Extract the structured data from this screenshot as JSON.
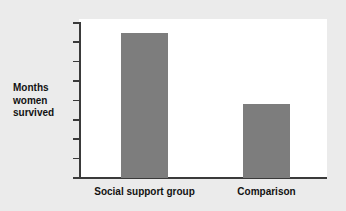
{
  "chart_data": {
    "type": "bar",
    "title": "",
    "xlabel": "",
    "ylabel": "Months\nwomen\nsurvived",
    "categories": [
      "Social support group",
      "Comparison"
    ],
    "values": [
      37.5,
      19.2
    ],
    "yticks": [
      "40",
      "35",
      "30",
      "25",
      "20",
      "15",
      "10",
      "5",
      "0"
    ],
    "ytick_values": [
      40,
      35,
      30,
      25,
      20,
      15,
      10,
      5,
      0
    ],
    "ylim": [
      0,
      40
    ],
    "grid": false,
    "legend": null,
    "series": [
      {
        "name": "Months women survived",
        "values": [
          37.5,
          19.2
        ]
      }
    ]
  },
  "style": {
    "bar_color": "#7d7d7d",
    "axis_color": "#3a3a3a",
    "plot_background": "#ffffff",
    "page_background": "#ebebeb",
    "text_color": "#121212"
  }
}
